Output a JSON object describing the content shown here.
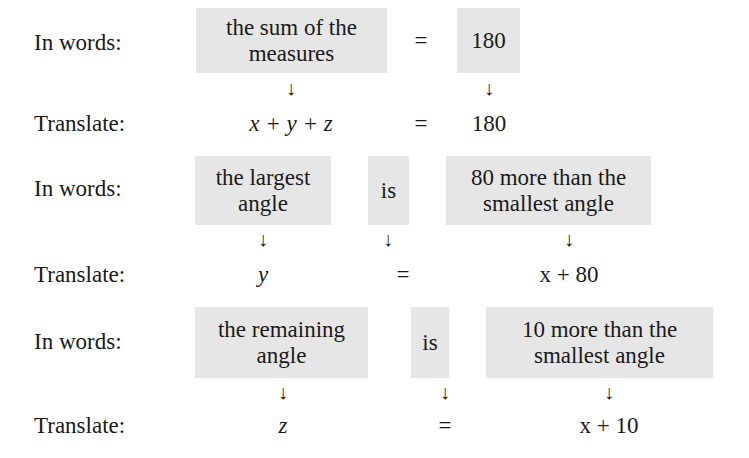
{
  "labels": {
    "in_words": "In words:",
    "translate": "Translate:"
  },
  "rows": [
    {
      "words": {
        "left": [
          "the sum of the",
          "measures"
        ],
        "verb": "=",
        "right": [
          "180"
        ]
      },
      "translate": {
        "left": "x + y + z",
        "verb": "=",
        "right": "180"
      }
    },
    {
      "words": {
        "left": [
          "the largest",
          "angle"
        ],
        "verb": "is",
        "right": [
          "80 more than the",
          "smallest angle"
        ]
      },
      "translate": {
        "left": "y",
        "verb": "=",
        "right": "x + 80"
      }
    },
    {
      "words": {
        "left": [
          "the remaining",
          "angle"
        ],
        "verb": "is",
        "right": [
          "10 more than the",
          "smallest angle"
        ]
      },
      "translate": {
        "left": "z",
        "verb": "=",
        "right": "x + 10"
      }
    }
  ],
  "arrow_glyph": "↓",
  "colors": {
    "box_fill": "#e6e6e6",
    "text": "#1a1a1a"
  }
}
